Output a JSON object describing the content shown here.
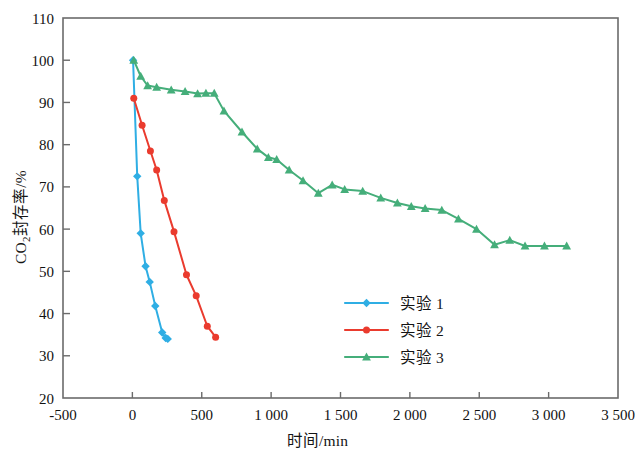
{
  "figure": {
    "background": "#ffffff",
    "frame_color": "#6b6b6b"
  },
  "axis": {
    "x_title": "时间/min",
    "y_title_prefix": "CO",
    "y_title_sub": "2",
    "y_title_suffix": "封存率/%",
    "x_ticks": [
      "-500",
      "0",
      "500",
      "1 000",
      "1 500",
      "2 000",
      "2 500",
      "3 000",
      "3 500"
    ],
    "y_ticks": [
      "20",
      "30",
      "40",
      "50",
      "60",
      "70",
      "80",
      "90",
      "100",
      "110"
    ]
  },
  "legend": {
    "items": [
      {
        "label": "实验 1",
        "color": "#2FAEE4",
        "marker": "diamond"
      },
      {
        "label": "实验 2",
        "color": "#EA3B2E",
        "marker": "circle"
      },
      {
        "label": "实验 3",
        "color": "#45AE7A",
        "marker": "triangle"
      }
    ]
  },
  "chart_data": {
    "type": "line",
    "title": "",
    "xlabel": "时间/min",
    "ylabel": "CO2封存率/%",
    "xlim": [
      -500,
      3500
    ],
    "ylim": [
      20,
      110
    ],
    "xticks": [
      -500,
      0,
      500,
      1000,
      1500,
      2000,
      2500,
      3000,
      3500
    ],
    "yticks": [
      20,
      30,
      40,
      50,
      60,
      70,
      80,
      90,
      100,
      110
    ],
    "grid": false,
    "legend_position": "center",
    "series": [
      {
        "name": "实验 1",
        "color": "#2FAEE4",
        "marker": "diamond",
        "points": [
          [
            5,
            100.0
          ],
          [
            35,
            72.5
          ],
          [
            60,
            59.0
          ],
          [
            95,
            51.2
          ],
          [
            125,
            47.5
          ],
          [
            165,
            41.8
          ],
          [
            215,
            35.5
          ],
          [
            240,
            34.2
          ],
          [
            255,
            34.0
          ]
        ]
      },
      {
        "name": "实验 2",
        "color": "#EA3B2E",
        "marker": "circle",
        "points": [
          [
            10,
            91.0
          ],
          [
            70,
            84.6
          ],
          [
            130,
            78.5
          ],
          [
            175,
            74.0
          ],
          [
            230,
            66.8
          ],
          [
            300,
            59.4
          ],
          [
            390,
            49.2
          ],
          [
            460,
            44.2
          ],
          [
            540,
            37.0
          ],
          [
            600,
            34.4
          ]
        ]
      },
      {
        "name": "实验 3",
        "color": "#45AE7A",
        "marker": "triangle",
        "points": [
          [
            10,
            100.0
          ],
          [
            60,
            96.2
          ],
          [
            110,
            94.0
          ],
          [
            175,
            93.6
          ],
          [
            280,
            93.0
          ],
          [
            380,
            92.6
          ],
          [
            470,
            92.1
          ],
          [
            530,
            92.2
          ],
          [
            590,
            92.2
          ],
          [
            660,
            88.0
          ],
          [
            790,
            83.0
          ],
          [
            900,
            79.0
          ],
          [
            980,
            77.0
          ],
          [
            1040,
            76.5
          ],
          [
            1130,
            74.0
          ],
          [
            1230,
            71.5
          ],
          [
            1340,
            68.5
          ],
          [
            1440,
            70.5
          ],
          [
            1530,
            69.4
          ],
          [
            1660,
            69.0
          ],
          [
            1790,
            67.4
          ],
          [
            1910,
            66.2
          ],
          [
            2010,
            65.4
          ],
          [
            2110,
            64.9
          ],
          [
            2230,
            64.5
          ],
          [
            2350,
            62.4
          ],
          [
            2480,
            60.0
          ],
          [
            2610,
            56.3
          ],
          [
            2720,
            57.4
          ],
          [
            2830,
            56.0
          ],
          [
            2970,
            56.0
          ],
          [
            3130,
            56.0
          ]
        ]
      }
    ]
  }
}
